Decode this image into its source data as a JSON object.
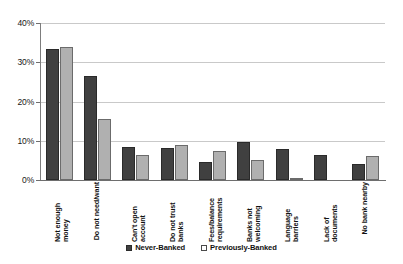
{
  "chart_data": {
    "type": "bar",
    "title": "",
    "xlabel": "",
    "ylabel": "",
    "ylim": [
      0,
      40
    ],
    "yticks": [
      0,
      10,
      20,
      30,
      40
    ],
    "ytick_labels": [
      "0%",
      "10%",
      "20%",
      "30%",
      "40%"
    ],
    "grid": true,
    "legend_position": "bottom",
    "categories": [
      "Not enough money",
      "Do not need/want",
      "Can't open account",
      "Do not trust banks",
      "Fees/balance requirements",
      "Banks not welcoming",
      "Language barriers",
      "Lack of documents",
      "No bank nearby"
    ],
    "series": [
      {
        "name": "Never-Banked",
        "color": "#404040",
        "values": [
          33.4,
          26.5,
          8.4,
          8.1,
          4.6,
          9.7,
          7.9,
          6.4,
          4.2
        ]
      },
      {
        "name": "Previously-Banked",
        "color": "#b0b0b0",
        "values": [
          33.9,
          15.5,
          6.4,
          8.9,
          7.4,
          5.1,
          0.4,
          0,
          6.1
        ]
      }
    ]
  },
  "legend": {
    "items": [
      {
        "label": "Never-Banked",
        "swatch": "never"
      },
      {
        "label": "Previously-Banked",
        "swatch": "prev"
      }
    ]
  }
}
